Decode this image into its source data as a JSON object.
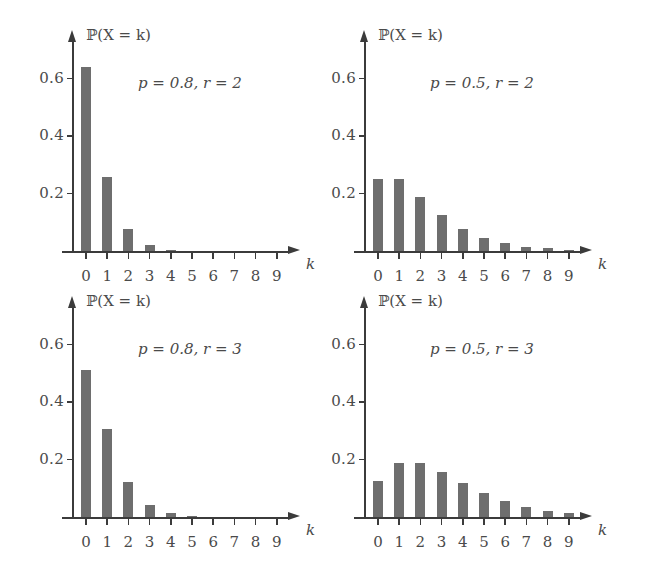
{
  "figure": {
    "bar_color": "#6e6e6e",
    "axis_color": "#3b3b3b",
    "text_color": "#4a4a4a"
  },
  "chart_data": [
    {
      "type": "bar",
      "title": "",
      "annotation": "p = 0.8,  r = 2",
      "param_p": "0.8",
      "param_r": "2",
      "ylabel": "ℙ(X = k)",
      "xlabel": "k",
      "categories": [
        "0",
        "1",
        "2",
        "3",
        "4",
        "5",
        "6",
        "7",
        "8",
        "9"
      ],
      "values": [
        0.64,
        0.256,
        0.0768,
        0.02048,
        0.00512,
        0.001229,
        0.000287,
        6.55e-05,
        1.47e-05,
        3.27e-06
      ],
      "ylim": [
        0,
        0.7
      ],
      "yticks": [
        "0.2",
        "0.4",
        "0.6"
      ],
      "ytick_values": [
        0.2,
        0.4,
        0.6
      ],
      "grid": false,
      "legend": "none"
    },
    {
      "type": "bar",
      "title": "",
      "annotation": "p = 0.5,  r = 2",
      "param_p": "0.5",
      "param_r": "2",
      "ylabel": "ℙ(X = k)",
      "xlabel": "k",
      "categories": [
        "0",
        "1",
        "2",
        "3",
        "4",
        "5",
        "6",
        "7",
        "8",
        "9"
      ],
      "values": [
        0.25,
        0.25,
        0.1875,
        0.125,
        0.078125,
        0.046875,
        0.02734,
        0.015625,
        0.008789,
        0.004883
      ],
      "ylim": [
        0,
        0.7
      ],
      "yticks": [
        "0.2",
        "0.4",
        "0.6"
      ],
      "ytick_values": [
        0.2,
        0.4,
        0.6
      ],
      "grid": false,
      "legend": "none"
    },
    {
      "type": "bar",
      "title": "",
      "annotation": "p = 0.8,  r = 3",
      "param_p": "0.8",
      "param_r": "3",
      "ylabel": "ℙ(X = k)",
      "xlabel": "k",
      "categories": [
        "0",
        "1",
        "2",
        "3",
        "4",
        "5",
        "6",
        "7",
        "8",
        "9"
      ],
      "values": [
        0.512,
        0.3072,
        0.12288,
        0.04096,
        0.012288,
        0.003441,
        0.000918,
        0.000236,
        5.9e-05,
        1.44e-05
      ],
      "ylim": [
        0,
        0.7
      ],
      "yticks": [
        "0.2",
        "0.4",
        "0.6"
      ],
      "ytick_values": [
        0.2,
        0.4,
        0.6
      ],
      "grid": false,
      "legend": "none"
    },
    {
      "type": "bar",
      "title": "",
      "annotation": "p = 0.5,  r = 3",
      "param_p": "0.5",
      "param_r": "3",
      "ylabel": "ℙ(X = k)",
      "xlabel": "k",
      "categories": [
        "0",
        "1",
        "2",
        "3",
        "4",
        "5",
        "6",
        "7",
        "8",
        "9"
      ],
      "values": [
        0.125,
        0.1875,
        0.1875,
        0.15625,
        0.11719,
        0.08203,
        0.05469,
        0.03516,
        0.02197,
        0.01343
      ],
      "ylim": [
        0,
        0.7
      ],
      "yticks": [
        "0.2",
        "0.4",
        "0.6"
      ],
      "ytick_values": [
        0.2,
        0.4,
        0.6
      ],
      "grid": false,
      "legend": "none"
    }
  ]
}
